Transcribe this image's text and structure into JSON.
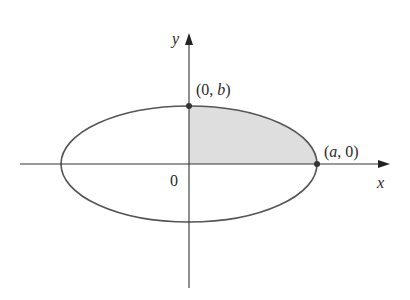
{
  "diagram": {
    "type": "ellipse-quadrant",
    "axes": {
      "x_label": "x",
      "y_label": "y",
      "origin_label": "0"
    },
    "points": [
      {
        "label_prefix": "(0, ",
        "label_var": "b",
        "label_suffix": ")"
      },
      {
        "label_prefix": "(",
        "label_var": "a",
        "label_suffix": ", 0)"
      }
    ],
    "colors": {
      "curve": "#555555",
      "axis": "#333333",
      "shade": "#dedede"
    }
  }
}
